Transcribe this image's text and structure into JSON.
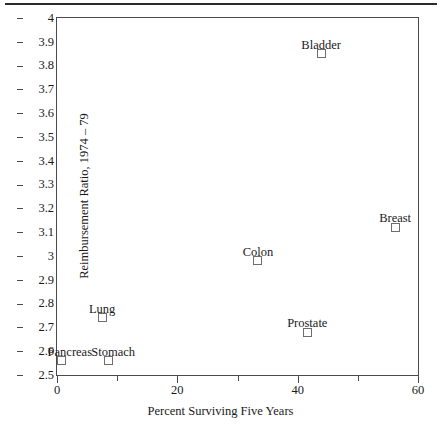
{
  "chart_data": {
    "type": "scatter",
    "title": "",
    "xlabel": "Percent Surviving Five Years",
    "ylabel": "Reimbursement Ratio, 1974 – 79",
    "xlim": [
      0,
      60
    ],
    "ylim": [
      2.5,
      4
    ],
    "grid": false,
    "legend": "none",
    "xticks": [
      {
        "value": 0,
        "label": "0",
        "major": true
      },
      {
        "value": 10,
        "label": "",
        "major": false
      },
      {
        "value": 20,
        "label": "20",
        "major": true
      },
      {
        "value": 30,
        "label": "",
        "major": false
      },
      {
        "value": 40,
        "label": "40",
        "major": true
      },
      {
        "value": 50,
        "label": "",
        "major": false
      },
      {
        "value": 60,
        "label": "60",
        "major": true
      }
    ],
    "yticks": [
      {
        "value": 4.0,
        "label": "4"
      },
      {
        "value": 3.9,
        "label": "3.9"
      },
      {
        "value": 3.8,
        "label": "3.8"
      },
      {
        "value": 3.7,
        "label": "3.7"
      },
      {
        "value": 3.6,
        "label": "3.6"
      },
      {
        "value": 3.5,
        "label": "3.5"
      },
      {
        "value": 3.4,
        "label": "3.4"
      },
      {
        "value": 3.3,
        "label": "3.3"
      },
      {
        "value": 3.2,
        "label": "3.2"
      },
      {
        "value": 3.1,
        "label": "3.1"
      },
      {
        "value": 3.0,
        "label": "3"
      },
      {
        "value": 2.9,
        "label": "2.9"
      },
      {
        "value": 2.8,
        "label": "2.8"
      },
      {
        "value": 2.7,
        "label": "2.7"
      },
      {
        "value": 2.6,
        "label": "2.6"
      },
      {
        "value": 2.5,
        "label": "2.5"
      }
    ],
    "points": [
      {
        "label": "Bladder",
        "x": 43.9,
        "y": 3.85,
        "label_dx": 0,
        "label_dy": -15
      },
      {
        "label": "Breast",
        "x": 56.2,
        "y": 3.12,
        "label_dx": 0,
        "label_dy": -15
      },
      {
        "label": "Colon",
        "x": 33.4,
        "y": 2.98,
        "label_dx": 0,
        "label_dy": -15
      },
      {
        "label": "Prostate",
        "x": 41.6,
        "y": 2.68,
        "label_dx": 0,
        "label_dy": -15
      },
      {
        "label": "Lung",
        "x": 7.5,
        "y": 2.74,
        "label_dx": 0,
        "label_dy": -15
      },
      {
        "label": "Pancreas",
        "x": 0.8,
        "y": 2.56,
        "label_dx": 8,
        "label_dy": -15
      },
      {
        "label": "Stomach",
        "x": 8.5,
        "y": 2.56,
        "label_dx": 5,
        "label_dy": -15
      }
    ],
    "colors": {
      "marker_stroke": "#6e6e6e",
      "axis": "#4a4a4a",
      "text": "#1a1a1a",
      "rule": "#2b2b2b",
      "background": "#ffffff"
    }
  }
}
